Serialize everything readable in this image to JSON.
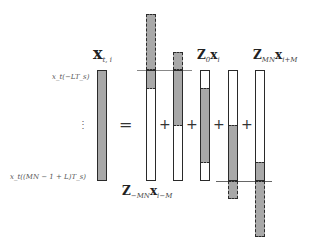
{
  "colors": {
    "fill": "#a8a8a8",
    "empty": "#ffffff",
    "border": "#2a2a2a",
    "refline": "#777777"
  },
  "labels": {
    "lhs": {
      "main": "x",
      "sub": "t, i"
    },
    "bar1": {
      "main": "Z",
      "sub": "−MN",
      "main2": "x",
      "sub2": "i−M"
    },
    "bar3": {
      "main": "Z",
      "sub": "0",
      "main2": "x",
      "sub2": "i"
    },
    "bar5": {
      "main": "Z",
      "sub": "MN",
      "main2": "x",
      "sub2": "i+M"
    },
    "top_sample": "x_t(−LT_s)",
    "bottom_sample": "x_t((MN − 1 + L)T_s)",
    "ellipsis": "⋮",
    "equals": "=",
    "plus": "+"
  },
  "diagram": {
    "window_top_y": 70,
    "window_bottom_y": 181,
    "lhs_bar": {
      "x": 97,
      "width": 10,
      "segments": [
        {
          "from": 70,
          "to": 181,
          "type": "filled"
        }
      ]
    },
    "rhs_bars": [
      {
        "id": "bar1",
        "x": 146,
        "width": 10,
        "segments": [
          {
            "from": 14,
            "to": 70,
            "type": "dashed-filled"
          },
          {
            "from": 70,
            "to": 88,
            "type": "filled"
          },
          {
            "from": 88,
            "to": 181,
            "type": "empty"
          }
        ]
      },
      {
        "id": "bar2",
        "x": 173,
        "width": 10,
        "segments": [
          {
            "from": 52,
            "to": 70,
            "type": "dashed-filled"
          },
          {
            "from": 70,
            "to": 125,
            "type": "filled"
          },
          {
            "from": 125,
            "to": 181,
            "type": "empty"
          }
        ]
      },
      {
        "id": "bar3",
        "x": 200,
        "width": 10,
        "segments": [
          {
            "from": 70,
            "to": 88,
            "type": "empty"
          },
          {
            "from": 88,
            "to": 162,
            "type": "filled"
          },
          {
            "from": 162,
            "to": 181,
            "type": "empty"
          }
        ]
      },
      {
        "id": "bar4",
        "x": 228,
        "width": 10,
        "segments": [
          {
            "from": 70,
            "to": 125,
            "type": "empty"
          },
          {
            "from": 125,
            "to": 181,
            "type": "filled"
          },
          {
            "from": 181,
            "to": 199,
            "type": "dashed-filled"
          }
        ]
      },
      {
        "id": "bar5",
        "x": 255,
        "width": 10,
        "segments": [
          {
            "from": 70,
            "to": 162,
            "type": "empty"
          },
          {
            "from": 162,
            "to": 181,
            "type": "filled"
          },
          {
            "from": 181,
            "to": 237,
            "type": "dashed-filled"
          }
        ]
      }
    ]
  }
}
